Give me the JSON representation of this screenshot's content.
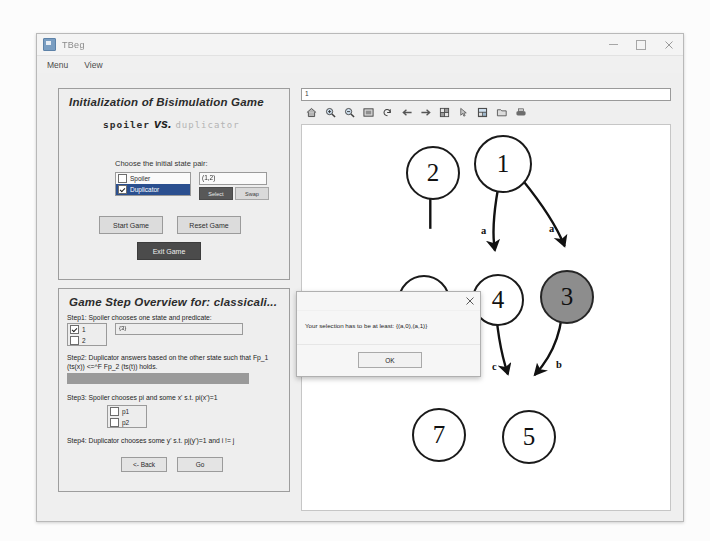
{
  "window": {
    "title": "TBeg",
    "minimize_label": "–",
    "maximize_label": "□",
    "close_label": "✕",
    "menus": [
      "Menu",
      "View"
    ]
  },
  "init_panel": {
    "title": "Initialization of Bisimulation Game",
    "spoiler": "spoiler",
    "vs": "vs.",
    "duplicator": "duplicator",
    "choose_label": "Choose the initial state pair:",
    "role_options": [
      {
        "label": "Spoiler",
        "checked": false,
        "selected": false
      },
      {
        "label": "Duplicator",
        "checked": true,
        "selected": true
      }
    ],
    "state_pair_value": "(1,2)",
    "select_button": "Select",
    "swap_button": "Swap",
    "start_button": "Start Game",
    "reset_button": "Reset Game",
    "exit_button": "Exit Game"
  },
  "steps_panel": {
    "title": "Game Step Overview for: classicali...",
    "step1_text": "Step1: Spoiler chooses one state and predicate:",
    "step1_options": [
      {
        "label": "1",
        "checked": true
      },
      {
        "label": "2",
        "checked": false
      }
    ],
    "step1_field_value": "{3}",
    "step2_text": "Step2: Duplicator answers based on the other state such that Fp_1 (ts(x)) <=^F Fp_2 (ts(t))  holds.",
    "step3_text": "Step3: Spoiler chooses pi and some x' s.t. pi(x')=1",
    "step3_options": [
      {
        "label": "p1",
        "checked": false
      },
      {
        "label": "p2",
        "checked": false
      }
    ],
    "step4_text": "Step4: Duplicator chooses some y' s.t. pj(y')=1 and i != j",
    "back_button": "<- Back",
    "go_button": "Go"
  },
  "graph_toolbar": {
    "url_value": "1",
    "icons": [
      "home-icon",
      "zoom-in-icon",
      "zoom-out-icon",
      "fit-screen-icon",
      "rotate-icon",
      "arrow-left-icon",
      "arrow-right-icon",
      "grid-icon",
      "pointer-icon",
      "layout-icon",
      "open-folder-icon",
      "print-icon"
    ]
  },
  "graph": {
    "nodes": [
      {
        "id": "2",
        "label": "2",
        "x": 393,
        "y": 156,
        "r": 25,
        "gray": false
      },
      {
        "id": "1",
        "label": "1",
        "x": 465,
        "y": 146,
        "r": 27,
        "gray": false
      },
      {
        "id": "6",
        "label": "6",
        "x": 384,
        "y": 292,
        "r": 24,
        "gray": false
      },
      {
        "id": "4",
        "label": "4",
        "x": 460,
        "y": 290,
        "r": 24,
        "gray": false
      },
      {
        "id": "3",
        "label": "3",
        "x": 526,
        "y": 288,
        "r": 25,
        "gray": true
      },
      {
        "id": "7",
        "label": "7",
        "x": 400,
        "y": 423,
        "r": 25,
        "gray": false
      },
      {
        "id": "5",
        "label": "5",
        "x": 489,
        "y": 425,
        "r": 25,
        "gray": false
      }
    ],
    "edges": [
      {
        "from": "2",
        "to": "6",
        "label": ""
      },
      {
        "from": "1",
        "to": "4",
        "label": "a"
      },
      {
        "from": "1",
        "to": "3",
        "label": "a"
      },
      {
        "from": "6",
        "to": "7",
        "label": "b"
      },
      {
        "from": "6",
        "to": "7",
        "label": "c"
      },
      {
        "from": "4",
        "to": "5",
        "label": "c"
      },
      {
        "from": "3",
        "to": "5",
        "label": "b"
      }
    ],
    "edge_labels": [
      {
        "text": "a",
        "x": 447,
        "y": 240
      },
      {
        "text": "a",
        "x": 516,
        "y": 238
      },
      {
        "text": "b",
        "x": 361,
        "y": 366
      },
      {
        "text": "c",
        "x": 437,
        "y": 362
      },
      {
        "text": "c",
        "x": 461,
        "y": 372
      },
      {
        "text": "b",
        "x": 523,
        "y": 371
      }
    ]
  },
  "dialog": {
    "message": "Your selection has to be at least: {(a,0),(a,1)}",
    "ok_button": "OK",
    "close_label": "✕"
  },
  "ghost": {
    "background_text": "",
    "faded_button": ""
  },
  "colors": {
    "window_bg": "#f0f0f0",
    "panel_bg": "#eeeeee",
    "selected_row": "#2a4f8f",
    "node_gray": "#8d8d8d",
    "step2_bar": "#9a9a9a",
    "exit_button": "#4b4b4b"
  }
}
